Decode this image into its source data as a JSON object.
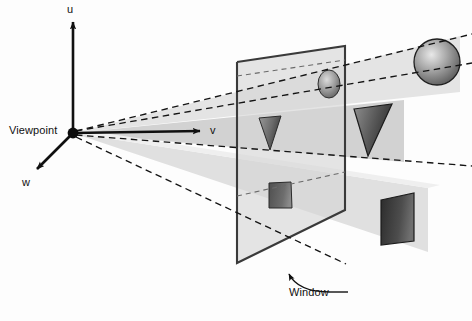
{
  "figure": {
    "background_color": "#fdfdfd",
    "labels": {
      "viewpoint": "Viewpoint",
      "axis_u": "u",
      "axis_v": "v",
      "axis_w": "w",
      "window": "Window"
    },
    "colors": {
      "ink": "#101010",
      "plane_fill": "#d7d7d7",
      "plane_stroke": "#3c3c3c",
      "beam_light": "#e2e2e2",
      "beam_mid": "#cfcfcf",
      "object_dark": "#3a3a3a",
      "object_light": "#c9c9c9",
      "dashed": "#1a1a1a"
    },
    "geometry": {
      "viewpoint": {
        "x": 73,
        "y": 133
      },
      "axes": [
        {
          "name": "u",
          "tip_x": 73,
          "tip_y": 18
        },
        {
          "name": "v",
          "tip_x": 205,
          "tip_y": 131
        },
        {
          "name": "w",
          "tip_x": 33,
          "tip_y": 172
        }
      ],
      "window_plane": {
        "top_left": {
          "x": 237,
          "y": 62
        },
        "top_right": {
          "x": 345,
          "y": 46
        },
        "bottom_right": {
          "x": 345,
          "y": 210
        },
        "bottom_left": {
          "x": 237,
          "y": 263
        }
      },
      "objects": [
        {
          "name": "sphere-far",
          "kind": "sphere",
          "cx": 437,
          "cy": 62,
          "r": 23
        },
        {
          "name": "sphere-projected",
          "kind": "ellipse",
          "cx": 329,
          "cy": 84,
          "rx": 11,
          "ry": 14
        },
        {
          "name": "triangle-far",
          "kind": "triangle",
          "points": "354,109 392,104 368,156"
        },
        {
          "name": "triangle-projected",
          "kind": "triangle",
          "points": "259,118 281,116 270,150"
        },
        {
          "name": "square-far",
          "kind": "quad",
          "points": "381,200 414,193 414,241 381,245"
        },
        {
          "name": "square-projected",
          "kind": "quad",
          "points": "269,183 291,182 292,208 269,208"
        }
      ]
    }
  }
}
